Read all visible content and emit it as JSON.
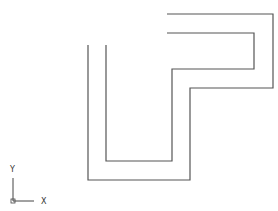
{
  "drawing": {
    "line_color": "#555555",
    "paths": [
      {
        "name": "outer-path",
        "points": "88,45 88,180 190,180 190,88 273,88 273,14 167,14"
      },
      {
        "name": "inner-path",
        "points": "106,45 106,161 172,161 172,69 254,69 254,33 167,33"
      }
    ]
  },
  "axes": {
    "y_label": "Y",
    "x_label": "X"
  }
}
